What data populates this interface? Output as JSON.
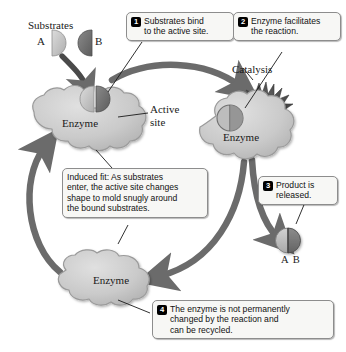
{
  "diagram": {
    "background": "#ffffff"
  },
  "labels": {
    "substrates": "Substrates",
    "substrate_a": "A",
    "substrate_b": "B",
    "enzyme_left": "Enzyme",
    "enzyme_catalysis": "Enzyme",
    "enzyme_bottom": "Enzyme",
    "active_site_line1": "Active",
    "active_site_line2": "site",
    "catalysis": "Catalysis",
    "product": "A  B"
  },
  "callouts": [
    {
      "number": "1",
      "lines": [
        "Substrates bind",
        "to the active site."
      ]
    },
    {
      "number": "2",
      "lines": [
        "Enzyme facilitates",
        "the reaction."
      ]
    },
    {
      "number": "3",
      "lines": [
        "Product is",
        "released."
      ]
    },
    {
      "number": "4",
      "lines": [
        "The enzyme is not permanently",
        "changed by the reaction and",
        "can be recycled."
      ]
    }
  ],
  "induced_fit": {
    "lines": [
      "Induced fit: As substrates",
      "enter, the active site changes",
      "shape to mold snugly around",
      "the bound substrates."
    ]
  },
  "colors": {
    "enzyme_fill": "#c9c9c9",
    "enzyme_stroke": "#9a9a9a",
    "substrate_light": "#c2c2c2",
    "substrate_dark": "#6e6e6e",
    "arrow": "#6b6b6b",
    "starburst": "#4a4a4a",
    "badge": "#000000",
    "callout_bg": "#f7f7f5",
    "callout_border": "#8d8d8d",
    "text": "#111111"
  }
}
